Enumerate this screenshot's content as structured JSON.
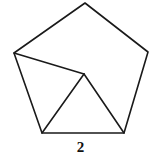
{
  "figure": {
    "background_color": "#ffffff",
    "stroke_color": "#1a1a1a",
    "stroke_width": 1.6,
    "width": 161,
    "height": 160
  },
  "labels": {
    "bottom_side_label": "2"
  },
  "chart_data": {
    "type": "diagram",
    "title": "",
    "points": {
      "pentagon_top": [
        85,
        3
      ],
      "pentagon_left": [
        14,
        53
      ],
      "pentagon_right": [
        148,
        52
      ],
      "pentagon_bottom_left": [
        42,
        133
      ],
      "pentagon_bottom_right": [
        124,
        133
      ],
      "interior_apex": [
        84,
        74
      ]
    },
    "pentagon_path": "M 85 3 L 148 52 L 124 133 L 42 133 L 14 53 Z",
    "interior_segments": [
      {
        "name": "left-vertex-to-apex",
        "d": "M 14 53 L 84 74"
      },
      {
        "name": "apex-to-bottom-left",
        "d": "M 84 74 L 42 133"
      },
      {
        "name": "apex-to-bottom-right",
        "d": "M 84 74 L 124 133"
      }
    ],
    "annotations": [
      {
        "text": "2",
        "x": 81,
        "y": 148,
        "attached_to": "bottom-edge"
      }
    ]
  }
}
